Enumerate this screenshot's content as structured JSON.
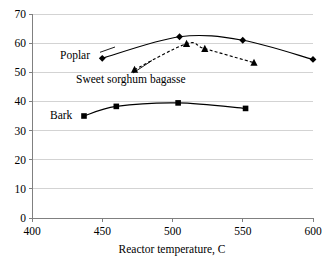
{
  "chart_data": {
    "type": "line",
    "title": "",
    "xlabel": "Reactor temperature, C",
    "ylabel": "",
    "xlim": [
      400,
      600
    ],
    "ylim": [
      0,
      70
    ],
    "xticks": [
      400,
      450,
      500,
      550,
      600
    ],
    "yticks": [
      0,
      10,
      20,
      30,
      40,
      50,
      60,
      70
    ],
    "grid": "horizontal",
    "legend_position": "inline-labels",
    "series": [
      {
        "name": "Poplar",
        "marker": "diamond",
        "linestyle": "solid",
        "color": "#000000",
        "x": [
          450,
          505,
          550,
          600
        ],
        "values": [
          54.8,
          62.2,
          61.0,
          54.4
        ]
      },
      {
        "name": "Sweet sorghum bagasse",
        "marker": "triangle",
        "linestyle": "dashed",
        "color": "#000000",
        "x": [
          473,
          510,
          523,
          558
        ],
        "values": [
          50.9,
          59.8,
          58.1,
          53.3
        ]
      },
      {
        "name": "Bark",
        "marker": "square",
        "linestyle": "solid",
        "color": "#000000",
        "x": [
          437,
          460,
          504,
          552
        ],
        "values": [
          35.0,
          38.3,
          39.5,
          37.6
        ]
      }
    ],
    "annotations": [
      {
        "text": "Poplar",
        "x": 430,
        "y": 55.5
      },
      {
        "text": "Sweet sorghum bagasse",
        "x": 470,
        "y": 47.5
      },
      {
        "text": "Bark",
        "x": 420,
        "y": 34.0
      }
    ]
  },
  "axis": {
    "x_tick_labels": [
      "400",
      "450",
      "500",
      "550",
      "600"
    ],
    "y_tick_labels": [
      "0",
      "10",
      "20",
      "30",
      "40",
      "50",
      "60",
      "70"
    ],
    "x_axis_title": "Reactor temperature, C"
  },
  "labels": {
    "poplar": "Poplar",
    "bagasse": "Sweet sorghum bagasse",
    "bark": "Bark"
  },
  "colors": {
    "plot_foreground": "#000000",
    "gridline": "#c8c8c8",
    "axis": "#808080",
    "background": "#ffffff"
  }
}
